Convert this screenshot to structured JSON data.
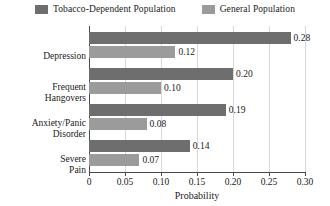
{
  "chart_data": {
    "type": "bar",
    "orientation": "horizontal",
    "title": "",
    "xlabel": "Probability",
    "ylabel": "",
    "xlim": [
      0,
      0.3
    ],
    "xticks": [
      "0",
      "0.05",
      "0.10",
      "0.15",
      "0.20",
      "0.25",
      "0.30"
    ],
    "xtick_values": [
      0,
      0.05,
      0.1,
      0.15,
      0.2,
      0.25,
      0.3
    ],
    "grid": true,
    "grid_axis": "x",
    "legend_position": "top-center",
    "categories": [
      "Depression",
      "Frequent Hangovers",
      "Anxiety/Panic Disorder",
      "Severe Pain"
    ],
    "category_lines": [
      [
        "Depression"
      ],
      [
        "Frequent",
        "Hangovers"
      ],
      [
        "Anxiety/Panic",
        "Disorder"
      ],
      [
        "Severe",
        "Pain"
      ]
    ],
    "series": [
      {
        "name": "Tobacco-Dependent Population",
        "color": "#6e6e6e",
        "values": [
          0.28,
          0.2,
          0.19,
          0.14
        ],
        "labels": [
          "0.28",
          "0.20",
          "0.19",
          "0.14"
        ]
      },
      {
        "name": "General Population",
        "color": "#9b9b9b",
        "values": [
          0.12,
          0.1,
          0.08,
          0.07
        ],
        "labels": [
          "0.12",
          "0.10",
          "0.08",
          "0.07"
        ]
      }
    ]
  },
  "legend": {
    "items": [
      {
        "label": "Tobacco-Dependent Population",
        "color": "#6e6e6e"
      },
      {
        "label": "General Population",
        "color": "#9b9b9b"
      }
    ]
  },
  "axis": {
    "x_title": "Probability"
  }
}
